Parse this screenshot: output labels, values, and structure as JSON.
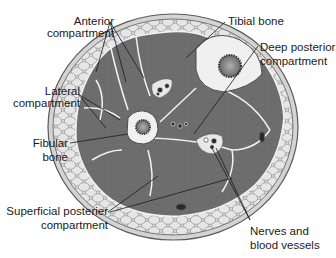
{
  "diagram": {
    "colors": {
      "background": "#ffffff",
      "skin_outer": "#d4d4d4",
      "skin_line": "#5a5a5a",
      "fat_tissue": "#dcdcdc",
      "fat_cells": "#8a8a8a",
      "muscle": "#6e6e6e",
      "muscle_texture": "#5c5c5c",
      "fascia": "#f2f2f2",
      "bone_cortex": "#f0f0f0",
      "bone_marrow": "#7a7a7a",
      "vessel": "#2a2a2a",
      "leader_line": "#1a1a1a",
      "text": "#1a1a1a"
    },
    "labels": {
      "anterior": {
        "line1": "Anterior",
        "line2": "compartment"
      },
      "lateral": {
        "line1": "Lateral",
        "line2": "compartment"
      },
      "fibular": {
        "line1": "Fibular",
        "line2": "bone"
      },
      "superficial": {
        "line1": "Superficial posterier",
        "line2": "compartment"
      },
      "tibial": {
        "line1": "Tibial bone"
      },
      "deep_posterior": {
        "line1": "Deep posterior",
        "line2": "compartment"
      },
      "nerves": {
        "line1": "Nerves and",
        "line2": "blood vessels"
      }
    }
  }
}
